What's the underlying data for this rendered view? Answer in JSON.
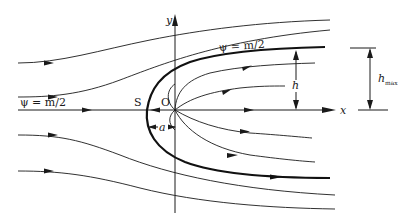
{
  "diagram": {
    "axes": {
      "x_label": "x",
      "y_label": "y"
    },
    "points": {
      "stagnation": "S",
      "origin": "O"
    },
    "labels": {
      "dividing_streamline_upper": "ψ = m/2",
      "dividing_streamline_axis": "ψ = m/2",
      "half_width": "h",
      "max_half_width": "h",
      "max_half_width_subscript": "max",
      "stagnation_distance": "a"
    },
    "colors": {
      "line": "#1a1a1a",
      "background": "#ffffff"
    }
  }
}
